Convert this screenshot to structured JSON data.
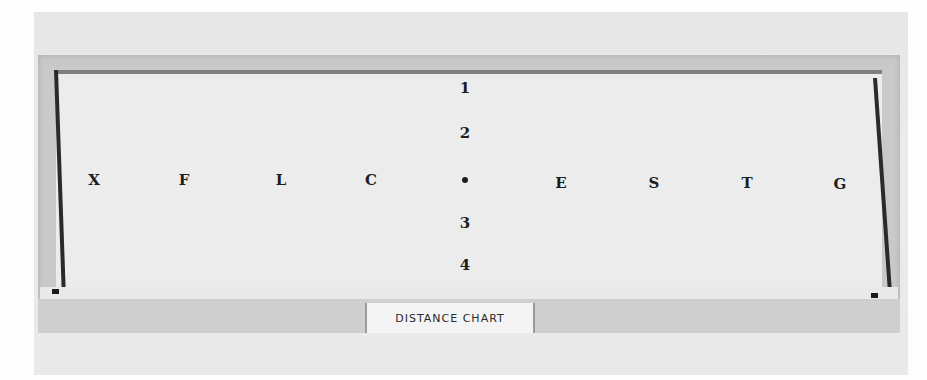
{
  "photo": {
    "subject": "Distance chart board",
    "label_card": "DISTANCE CHART",
    "center_marker": "•",
    "horizontal_letters": [
      {
        "text": "X",
        "x": 94,
        "y": 180
      },
      {
        "text": "F",
        "x": 184,
        "y": 180
      },
      {
        "text": "L",
        "x": 281,
        "y": 180
      },
      {
        "text": "C",
        "x": 371,
        "y": 180
      },
      {
        "text": "E",
        "x": 561,
        "y": 183
      },
      {
        "text": "S",
        "x": 654,
        "y": 183
      },
      {
        "text": "T",
        "x": 747,
        "y": 183
      },
      {
        "text": "G",
        "x": 840,
        "y": 184
      }
    ],
    "vertical_numbers": [
      {
        "text": "1",
        "x": 465,
        "y": 88
      },
      {
        "text": "2",
        "x": 465,
        "y": 133
      },
      {
        "text": "3",
        "x": 465,
        "y": 223
      },
      {
        "text": "4",
        "x": 465,
        "y": 265
      }
    ],
    "center_dot": {
      "x": 465,
      "y": 180
    }
  }
}
